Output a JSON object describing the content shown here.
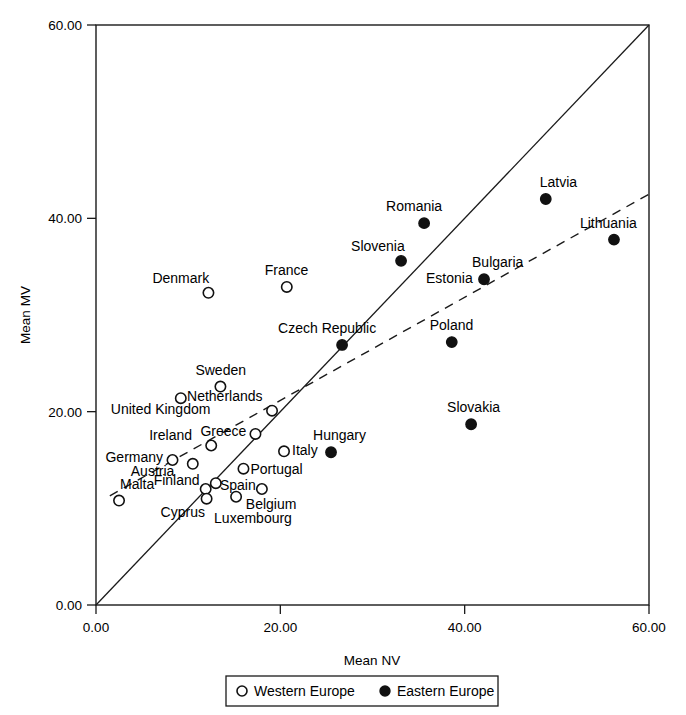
{
  "chart_data": {
    "type": "scatter",
    "title": "",
    "xlabel": "Mean NV",
    "ylabel": "Mean MV",
    "xlim": [
      0,
      60
    ],
    "ylim": [
      0,
      60
    ],
    "grid": false,
    "xticks": [
      "0.00",
      "20.00",
      "40.00",
      "60.00"
    ],
    "yticks": [
      "0.00",
      "20.00",
      "40.00",
      "60.00"
    ],
    "xtick_values": [
      0,
      20,
      40,
      60
    ],
    "ytick_values": [
      0,
      20,
      40,
      60
    ],
    "legend_position": "bottom-center-outside",
    "annotations": [
      "Solid diagonal line is the identity line y = x",
      "Dashed line is a linear regression / trend line"
    ],
    "reference_line": {
      "kind": "identity",
      "style": "solid",
      "from": [
        0,
        0
      ],
      "to": [
        60,
        60
      ]
    },
    "trend_line": {
      "kind": "linear-fit",
      "style": "dashed",
      "from": [
        1.5,
        11.3
      ],
      "to": [
        60,
        42.5
      ]
    },
    "series": [
      {
        "name": "Western Europe",
        "marker": "open-circle",
        "marker_color": "#ffffff",
        "edge_color": "#111111",
        "points": [
          {
            "label": "Denmark",
            "x": 12.2,
            "y": 32.3,
            "label_dx": -56,
            "label_dy": -10
          },
          {
            "label": "France",
            "x": 20.7,
            "y": 32.9,
            "label_dx": -22,
            "label_dy": -12
          },
          {
            "label": "Sweden",
            "x": 13.5,
            "y": 22.6,
            "label_dx": -25,
            "label_dy": -12
          },
          {
            "label": "United Kingdom",
            "x": 9.2,
            "y": 21.4,
            "label_dx": -70,
            "label_dy": 16
          },
          {
            "label": "Netherlands",
            "x": 19.1,
            "y": 20.1,
            "label_dx": -85,
            "label_dy": -10
          },
          {
            "label": "Greece",
            "x": 17.3,
            "y": 17.7,
            "label_dx": -55,
            "label_dy": 2
          },
          {
            "label": "Ireland",
            "x": 12.5,
            "y": 16.5,
            "label_dx": -62,
            "label_dy": -6
          },
          {
            "label": "Italy",
            "x": 20.4,
            "y": 15.9,
            "label_dx": 8,
            "label_dy": 4
          },
          {
            "label": "Germany",
            "x": 8.3,
            "y": 15.0,
            "label_dx": -67,
            "label_dy": 2
          },
          {
            "label": "Austria",
            "x": 10.5,
            "y": 14.6,
            "label_dx": -62,
            "label_dy": 12
          },
          {
            "label": "Portugal",
            "x": 16.0,
            "y": 14.1,
            "label_dx": 7,
            "label_dy": 5
          },
          {
            "label": "Finland",
            "x": 11.9,
            "y": 12.0,
            "label_dx": -52,
            "label_dy": -4
          },
          {
            "label": "Spain",
            "x": 18.0,
            "y": 12.0,
            "label_dx": -42,
            "label_dy": 1
          },
          {
            "label": "Belgium",
            "x": 13.0,
            "y": 12.6,
            "label_dx": 30,
            "label_dy": 26
          },
          {
            "label": "Malta",
            "x": 2.5,
            "y": 10.8,
            "label_dx": 1,
            "label_dy": -12
          },
          {
            "label": "Cyprus",
            "x": 12.0,
            "y": 11.0,
            "label_dx": -46,
            "label_dy": 18
          },
          {
            "label": "Luxembourg",
            "x": 15.2,
            "y": 11.2,
            "label_dx": -22,
            "label_dy": 26
          }
        ]
      },
      {
        "name": "Eastern Europe",
        "marker": "filled-circle",
        "marker_color": "#111111",
        "edge_color": "#111111",
        "points": [
          {
            "label": "Latvia",
            "x": 48.8,
            "y": 42.0,
            "label_dx": -6,
            "label_dy": -12
          },
          {
            "label": "Lithuania",
            "x": 56.2,
            "y": 37.8,
            "label_dx": -34,
            "label_dy": -12
          },
          {
            "label": "Romania",
            "x": 35.6,
            "y": 39.5,
            "label_dx": -38,
            "label_dy": -12
          },
          {
            "label": "Slovenia",
            "x": 33.1,
            "y": 35.6,
            "label_dx": -50,
            "label_dy": -10
          },
          {
            "label": "Estonia",
            "x": 42.1,
            "y": 33.7,
            "label_dx": -58,
            "label_dy": 4
          },
          {
            "label": "Bulgaria",
            "x": 42.1,
            "y": 33.7,
            "label_dx": -12,
            "label_dy": -12
          },
          {
            "label": "Poland",
            "x": 38.6,
            "y": 27.2,
            "label_dx": -22,
            "label_dy": -12
          },
          {
            "label": "Czech Republic",
            "x": 26.7,
            "y": 26.9,
            "label_dx": -64,
            "label_dy": -12
          },
          {
            "label": "Slovakia",
            "x": 40.7,
            "y": 18.7,
            "label_dx": -24,
            "label_dy": -12
          },
          {
            "label": "Hungary",
            "x": 25.5,
            "y": 15.8,
            "label_dx": -18,
            "label_dy": -12
          }
        ]
      }
    ]
  },
  "legend": {
    "entries": [
      {
        "label": "Western Europe",
        "marker": "open-circle"
      },
      {
        "label": "Eastern Europe",
        "marker": "filled-circle"
      }
    ]
  },
  "colors": {
    "axis": "#1a1a1a",
    "ink": "#111111",
    "background": "#ffffff"
  }
}
